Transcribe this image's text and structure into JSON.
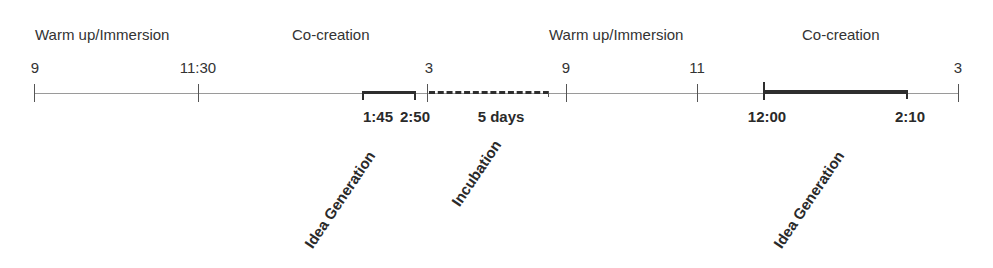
{
  "diagram": {
    "type": "timeline",
    "phases": [
      {
        "label": "Warm up/Immersion"
      },
      {
        "label": "Co-creation"
      },
      {
        "label": "Warm up/Immersion"
      },
      {
        "label": "Co-creation"
      }
    ],
    "ticks": [
      {
        "label": "9"
      },
      {
        "label": "11:30"
      },
      {
        "label": "3"
      },
      {
        "label": "9"
      },
      {
        "label": "11"
      },
      {
        "label": "3"
      }
    ],
    "intervals": [
      {
        "start": "1:45",
        "end": "2:50",
        "label": "Idea Generation"
      },
      {
        "duration": "5 days",
        "label": "Incubation"
      },
      {
        "start": "12:00",
        "end": "2:10",
        "label": "Idea Generation"
      }
    ],
    "colors": {
      "line": "#9a9a9a",
      "bar": "#2e2e2e",
      "text": "#2a2a2a"
    }
  }
}
